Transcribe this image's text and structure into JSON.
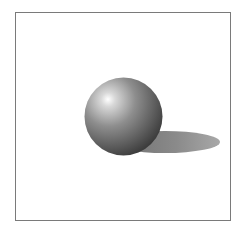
{
  "scene": {
    "description": "Rendered shaded sphere casting an elliptical shadow inside a framed box",
    "frame_color": "#7a7a7a",
    "background_color": "#ffffff",
    "sphere": {
      "cx": 123.5,
      "cy": 116.5,
      "r": 39,
      "highlight_color": "#ffffff",
      "mid_color": "#8a8a8a",
      "dark_color": "#3a3a3a"
    },
    "shadow": {
      "cx": 165,
      "cy": 142,
      "rx": 55,
      "ry": 11,
      "color": "#8c8c8c"
    }
  }
}
